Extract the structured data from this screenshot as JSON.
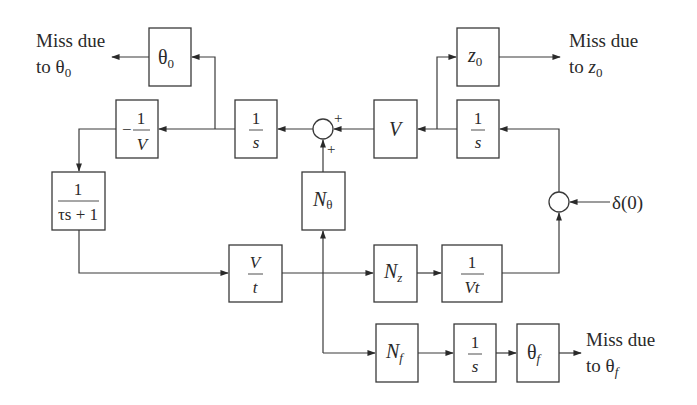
{
  "diagram": {
    "type": "block-diagram",
    "blocks": {
      "theta0": {
        "label": "θ",
        "sub": "0"
      },
      "neg_inv_v": {
        "sign": "−",
        "num": "1",
        "den": "V"
      },
      "integrator_theta": {
        "num": "1",
        "den": "s"
      },
      "velocity": {
        "label": "V"
      },
      "integrator_z": {
        "num": "1",
        "den": "s"
      },
      "z0": {
        "label": "z",
        "sub": "0"
      },
      "lag": {
        "num": "1",
        "den": "τs + 1"
      },
      "n_theta": {
        "label": "N",
        "sub": "θ"
      },
      "v_over_t": {
        "num": "V",
        "den": "t"
      },
      "n_z": {
        "label": "N",
        "sub": "z"
      },
      "inv_vt": {
        "num": "1",
        "den": "Vt"
      },
      "n_f": {
        "label": "N",
        "sub": "f"
      },
      "integrator_f": {
        "num": "1",
        "den": "s"
      },
      "theta_f": {
        "label": "θ",
        "sub": "f"
      }
    },
    "summing_junctions": {
      "upper": {
        "sign_right": "+",
        "sign_bottom": "+"
      },
      "right": {}
    },
    "inputs": {
      "delta": "δ(0)"
    },
    "outputs": {
      "theta0": {
        "line1": "Miss due",
        "line2_prefix": "to θ",
        "line2_sub": "0"
      },
      "z0": {
        "line1": "Miss due",
        "line2_prefix": "to ",
        "line2_var": "z",
        "line2_sub": "0"
      },
      "thetaf": {
        "line1": "Miss due",
        "line2_prefix": "to θ",
        "line2_sub": "f"
      }
    }
  }
}
